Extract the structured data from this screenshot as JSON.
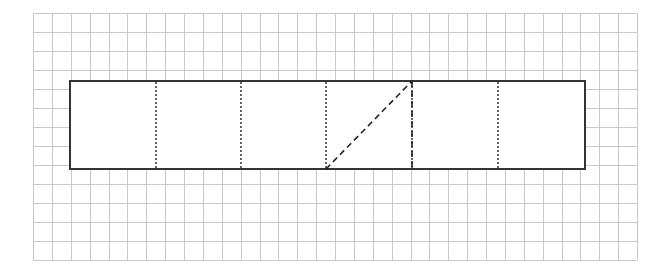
{
  "diagram": {
    "title": "",
    "background": "#ffffff",
    "grid": {
      "x0": 33,
      "y0": 13,
      "x1": 637,
      "y1": 260,
      "cols": 32,
      "rows": 13,
      "color": "#c8c8c8"
    },
    "net_rectangle": {
      "x": 70,
      "y": 81,
      "width": 515,
      "height": 88,
      "stroke": "#333333",
      "panels": 6
    },
    "fold_lines_dotted": [
      156,
      241,
      326,
      412,
      498
    ],
    "cut_lines_dashed": [
      {
        "x1": 326,
        "y1": 169,
        "x2": 412,
        "y2": 81
      },
      {
        "x1": 412,
        "y1": 81,
        "x2": 412,
        "y2": 169
      }
    ]
  }
}
